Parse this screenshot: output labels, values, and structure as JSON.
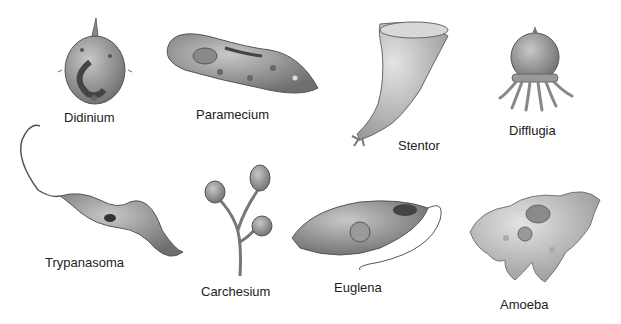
{
  "diagram": {
    "title": "",
    "organisms": [
      {
        "name": "Didinium"
      },
      {
        "name": "Paramecium"
      },
      {
        "name": "Stentor"
      },
      {
        "name": "Difflugia"
      },
      {
        "name": "Trypanasoma"
      },
      {
        "name": "Carchesium"
      },
      {
        "name": "Euglena"
      },
      {
        "name": "Amoeba"
      }
    ]
  }
}
